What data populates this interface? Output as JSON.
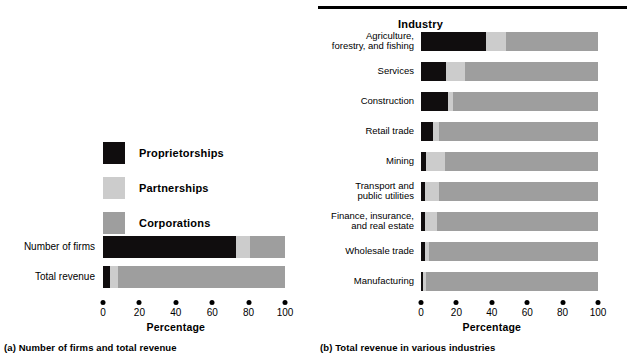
{
  "figure": {
    "panel_a_caption": "(a) Number of firms and total revenue",
    "panel_b_caption": "(b) Total revenue in various industries"
  },
  "colors": {
    "proprietorships": "#100d0e",
    "partnerships": "#cccccc",
    "corporations": "#9e9e9e",
    "axis": "#000000",
    "background": "#ffffff"
  },
  "legend": {
    "items": [
      {
        "label": "Proprietorships",
        "color_key": "proprietorships"
      },
      {
        "label": "Partnerships",
        "color_key": "partnerships"
      },
      {
        "label": "Corporations",
        "color_key": "corporations"
      }
    ]
  },
  "axis": {
    "title": "Percentage",
    "ticks": [
      "0",
      "20",
      "40",
      "60",
      "80",
      "100"
    ],
    "min": 0,
    "max": 100
  },
  "panel_b_header": "Industry",
  "chart_data": [
    {
      "id": "panel-a",
      "type": "bar",
      "orientation": "horizontal",
      "stacked": true,
      "title": "(a) Number of firms and total revenue",
      "xlabel": "Percentage",
      "ylabel": "",
      "xlim": [
        0,
        100
      ],
      "xticks": [
        0,
        20,
        40,
        60,
        80,
        100
      ],
      "grid": false,
      "legend_position": "upper-left",
      "categories": [
        "Number of firms",
        "Total revenue"
      ],
      "series": [
        {
          "name": "Proprietorships",
          "color": "#100d0e",
          "values": [
            73,
            4
          ]
        },
        {
          "name": "Partnerships",
          "color": "#cccccc",
          "values": [
            8,
            4
          ]
        },
        {
          "name": "Corporations",
          "color": "#9e9e9e",
          "values": [
            19,
            92
          ]
        }
      ]
    },
    {
      "id": "panel-b",
      "type": "bar",
      "orientation": "horizontal",
      "stacked": true,
      "title": "(b) Total revenue in various industries",
      "xlabel": "Percentage",
      "ylabel": "Industry",
      "xlim": [
        0,
        100
      ],
      "xticks": [
        0,
        20,
        40,
        60,
        80,
        100
      ],
      "grid": false,
      "legend_position": "none",
      "categories": [
        "Agriculture, forestry, and fishing",
        "Services",
        "Construction",
        "Retail trade",
        "Mining",
        "Transport and public utilities",
        "Finance, insurance, and real estate",
        "Wholesale trade",
        "Manufacturing"
      ],
      "series": [
        {
          "name": "Proprietorships",
          "color": "#100d0e",
          "values": [
            37,
            14,
            15,
            7,
            3,
            2.5,
            2,
            2,
            1
          ]
        },
        {
          "name": "Partnerships",
          "color": "#cccccc",
          "values": [
            11,
            11,
            3,
            3,
            10.5,
            7.5,
            7,
            2.5,
            2
          ]
        },
        {
          "name": "Corporations",
          "color": "#9e9e9e",
          "values": [
            52,
            75,
            82,
            90,
            86.5,
            90,
            91,
            95.5,
            97
          ]
        }
      ]
    }
  ],
  "panel_a_rows": [
    {
      "label": "Number of firms",
      "segments": [
        73,
        8,
        19
      ]
    },
    {
      "label": "Total revenue",
      "segments": [
        4,
        4,
        92
      ]
    }
  ],
  "panel_b_rows": [
    {
      "label_line1": "Agriculture,",
      "label_line2": "forestry, and fishing",
      "segments": [
        37,
        11,
        52
      ]
    },
    {
      "label_line1": "Services",
      "label_line2": "",
      "segments": [
        14,
        11,
        75
      ]
    },
    {
      "label_line1": "Construction",
      "label_line2": "",
      "segments": [
        15,
        3,
        82
      ]
    },
    {
      "label_line1": "Retail trade",
      "label_line2": "",
      "segments": [
        7,
        3,
        90
      ]
    },
    {
      "label_line1": "Mining",
      "label_line2": "",
      "segments": [
        3,
        10.5,
        86.5
      ]
    },
    {
      "label_line1": "Transport and",
      "label_line2": "public utilities",
      "segments": [
        2.5,
        7.5,
        90
      ]
    },
    {
      "label_line1": "Finance, insurance,",
      "label_line2": "and real estate",
      "segments": [
        2,
        7,
        91
      ]
    },
    {
      "label_line1": "Wholesale trade",
      "label_line2": "",
      "segments": [
        2,
        2.5,
        95.5
      ]
    },
    {
      "label_line1": "Manufacturing",
      "label_line2": "",
      "segments": [
        1,
        2,
        97
      ]
    }
  ]
}
